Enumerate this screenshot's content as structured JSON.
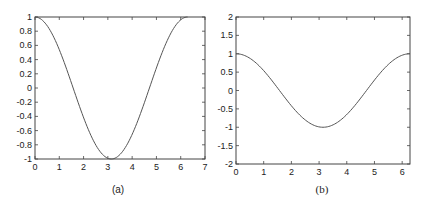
{
  "chart_data": [
    {
      "id": "a",
      "type": "line",
      "caption": "(a)",
      "title": "",
      "xlabel": "",
      "ylabel": "",
      "xlim": [
        0,
        7
      ],
      "ylim": [
        -1,
        1
      ],
      "xticks": [
        0,
        1,
        2,
        3,
        4,
        5,
        6,
        7
      ],
      "xtick_labels": [
        "0",
        "1",
        "2",
        "3",
        "4",
        "5",
        "6",
        "7"
      ],
      "yticks": [
        -1,
        -0.8,
        -0.6,
        -0.4,
        -0.2,
        0,
        0.2,
        0.4,
        0.6,
        0.8,
        1
      ],
      "ytick_labels": [
        "-1",
        "-0.8",
        "-0.6",
        "-0.4",
        "-0.2",
        "0",
        "0.2",
        "0.4",
        "0.6",
        "0.8",
        "1"
      ],
      "grid": false,
      "legend": null,
      "series": [
        {
          "name": "cos(x)",
          "function": "cos(x)",
          "x_range": [
            0,
            6.2832
          ],
          "x": [
            0,
            0.5,
            1,
            1.5,
            2,
            2.5,
            3,
            3.1416,
            3.5,
            4,
            4.5,
            5,
            5.5,
            6,
            6.2832
          ],
          "values": [
            1,
            0.878,
            0.54,
            0.071,
            -0.416,
            -0.801,
            -0.99,
            -1,
            -0.936,
            -0.654,
            -0.211,
            0.284,
            0.709,
            0.96,
            1
          ],
          "color": "#555555"
        }
      ]
    },
    {
      "id": "b",
      "type": "line",
      "caption": "(b)",
      "title": "",
      "xlabel": "",
      "ylabel": "",
      "xlim": [
        0,
        6.2832
      ],
      "ylim": [
        -2,
        2
      ],
      "xticks": [
        0,
        1,
        2,
        3,
        4,
        5,
        6
      ],
      "xtick_labels": [
        "0",
        "1",
        "2",
        "3",
        "4",
        "5",
        "6"
      ],
      "yticks": [
        -2,
        -1.5,
        -1,
        -0.5,
        0,
        0.5,
        1,
        1.5,
        2
      ],
      "ytick_labels": [
        "-2",
        "-1.5",
        "-1",
        "-0.5",
        "0",
        "0.5",
        "1",
        "1.5",
        "2"
      ],
      "grid": false,
      "legend": null,
      "series": [
        {
          "name": "cos(x)",
          "function": "cos(x)",
          "x_range": [
            0,
            6.2832
          ],
          "x": [
            0,
            0.5,
            1,
            1.5,
            2,
            2.5,
            3,
            3.1416,
            3.5,
            4,
            4.5,
            5,
            5.5,
            6,
            6.2832
          ],
          "values": [
            1,
            0.878,
            0.54,
            0.071,
            -0.416,
            -0.801,
            -0.99,
            -1,
            -0.936,
            -0.654,
            -0.211,
            0.284,
            0.709,
            0.96,
            1
          ],
          "color": "#555555"
        }
      ]
    }
  ],
  "frames": [
    {
      "left": 35,
      "top": 17,
      "right": 205,
      "bottom": 159,
      "caption_x": 118,
      "caption_y": 193,
      "caption_class": "caption-a"
    },
    {
      "left": 236,
      "top": 17,
      "right": 410,
      "bottom": 164,
      "caption_x": 322,
      "caption_y": 193,
      "caption_class": "caption"
    }
  ]
}
